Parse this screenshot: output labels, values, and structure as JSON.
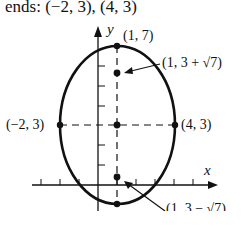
{
  "header": {
    "text": "ends:  (−2, 3), (4, 3)"
  },
  "labels": {
    "top_vertex": "(1, 7)",
    "upper_focus": "(1, 3 + √7)",
    "left_vertex": "(−2, 3)",
    "right_vertex": "(4, 3)",
    "lower_focus": "(1, 3 − √7)",
    "x_axis": "x",
    "y_axis": "y"
  },
  "ellipse": {
    "center": [
      1,
      3
    ],
    "semi_major_vertical": 4,
    "semi_minor_horizontal": 3,
    "foci": [
      [
        1,
        "3+√7"
      ],
      [
        1,
        "3−√7"
      ]
    ],
    "vertices": [
      [
        1,
        7
      ],
      [
        1,
        -1
      ]
    ],
    "co_vertices": [
      [
        -2,
        3
      ],
      [
        4,
        3
      ]
    ]
  },
  "colors": {
    "stroke": "#111111",
    "background": "#ffffff"
  }
}
